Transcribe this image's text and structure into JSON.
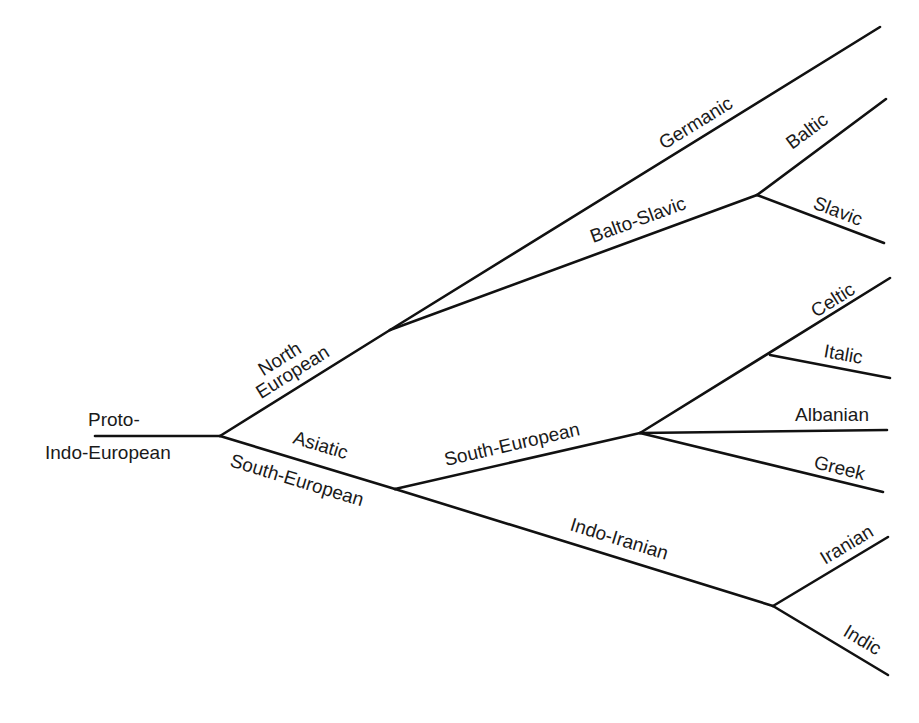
{
  "diagram": {
    "line_color": "#111111",
    "text_color": "#1a1a1a",
    "root": {
      "label_line1": "Proto-",
      "label_line2": "Indo-European"
    },
    "branches": {
      "north_european": {
        "line1": "North",
        "line2": "European"
      },
      "asiatic": "Asiatic",
      "south_european_lower": "South-European",
      "germanic": "Germanic",
      "balto_slavic": "Balto-Slavic",
      "baltic": "Baltic",
      "slavic": "Slavic",
      "south_european": "South-European",
      "celtic": "Celtic",
      "italic": "Italic",
      "albanian": "Albanian",
      "greek": "Greek",
      "indo_iranian": "Indo-Iranian",
      "iranian": "Iranian",
      "indic": "Indic"
    },
    "tree": {
      "name": "Proto-Indo-European",
      "children": [
        {
          "name": "North European",
          "children": [
            {
              "name": "Germanic"
            },
            {
              "name": "Balto-Slavic",
              "children": [
                {
                  "name": "Baltic"
                },
                {
                  "name": "Slavic"
                }
              ]
            }
          ]
        },
        {
          "name": "Asiatic / South-European",
          "children": [
            {
              "name": "South-European",
              "children": [
                {
                  "name": "Celtic"
                },
                {
                  "name": "Italic"
                },
                {
                  "name": "Albanian"
                },
                {
                  "name": "Greek"
                }
              ]
            },
            {
              "name": "Indo-Iranian",
              "children": [
                {
                  "name": "Iranian"
                },
                {
                  "name": "Indic"
                }
              ]
            }
          ]
        }
      ]
    }
  }
}
